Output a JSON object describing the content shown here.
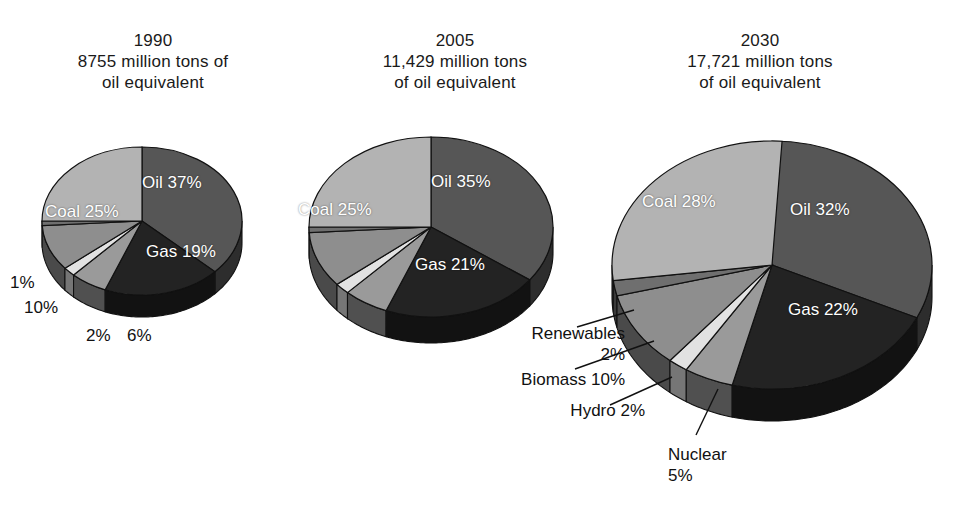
{
  "figure": {
    "background": "#ffffff",
    "label_color_inside": "#ffffff",
    "label_color_outside": "#111111"
  },
  "palette": {
    "oil": "#565656",
    "gas": "#232323",
    "coal": "#b3b3b3",
    "biomass": "#8e8e8e",
    "hydro": "#e2e2e2",
    "nuclear": "#9a9a9a",
    "renewables": "#6f6f6f",
    "edge": "#111111",
    "side_dark": "#2b2b2b"
  },
  "charts": [
    {
      "id": "1990",
      "title": "1990\n8755 million tons of\noil equivalent",
      "year": "1990",
      "total_text": "8755 million tons of oil equivalent",
      "slices": [
        {
          "name": "Oil",
          "label": "Oil 37%",
          "value": 37,
          "color_key": "oil",
          "inside": true
        },
        {
          "name": "Gas",
          "label": "Gas 19%",
          "value": 19,
          "color_key": "gas",
          "inside": true
        },
        {
          "name": "Nuclear",
          "label": "6%",
          "value": 6,
          "color_key": "nuclear",
          "inside": false
        },
        {
          "name": "Hydro",
          "label": "2%",
          "value": 2,
          "color_key": "hydro",
          "inside": false
        },
        {
          "name": "Biomass",
          "label": "10%",
          "value": 10,
          "color_key": "biomass",
          "inside": false
        },
        {
          "name": "Renewables",
          "label": "1%",
          "value": 1,
          "color_key": "renewables",
          "inside": false
        },
        {
          "name": "Coal",
          "label": "Coal 25%",
          "value": 25,
          "color_key": "coal",
          "inside": true
        }
      ]
    },
    {
      "id": "2005",
      "title": "2005\n11,429 million tons\nof oil equivalent",
      "year": "2005",
      "total_text": "11,429 million tons of oil equivalent",
      "slices": [
        {
          "name": "Oil",
          "label": "Oil 35%",
          "value": 35,
          "color_key": "oil",
          "inside": true
        },
        {
          "name": "Gas",
          "label": "Gas 21%",
          "value": 21,
          "color_key": "gas",
          "inside": true
        },
        {
          "name": "Nuclear",
          "label": "6%",
          "value": 6,
          "color_key": "nuclear",
          "inside": false
        },
        {
          "name": "Hydro",
          "label": "2%",
          "value": 2,
          "color_key": "hydro",
          "inside": false
        },
        {
          "name": "Biomass",
          "label": "10%",
          "value": 10,
          "color_key": "biomass",
          "inside": false
        },
        {
          "name": "Renewables",
          "label": "1%",
          "value": 1,
          "color_key": "renewables",
          "inside": false
        },
        {
          "name": "Coal",
          "label": "Coal 25%",
          "value": 25,
          "color_key": "coal",
          "inside": true
        }
      ]
    },
    {
      "id": "2030",
      "title": "2030\n17,721 million tons\nof oil equivalent",
      "year": "2030",
      "total_text": "17,721 million tons of oil equivalent",
      "slices": [
        {
          "name": "Oil",
          "label": "Oil 32%",
          "value": 32,
          "color_key": "oil",
          "inside": true
        },
        {
          "name": "Gas",
          "label": "Gas 22%",
          "value": 22,
          "color_key": "gas",
          "inside": true
        },
        {
          "name": "Nuclear",
          "label": "Nuclear\n5%",
          "value": 5,
          "color_key": "nuclear",
          "inside": false
        },
        {
          "name": "Hydro",
          "label": "Hydro 2%",
          "value": 2,
          "color_key": "hydro",
          "inside": false
        },
        {
          "name": "Biomass",
          "label": "Biomass 10%",
          "value": 10,
          "color_key": "biomass",
          "inside": false
        },
        {
          "name": "Renewables",
          "label": "Renewables\n2%",
          "value": 2,
          "color_key": "renewables",
          "inside": false
        },
        {
          "name": "Coal",
          "label": "Coal 28%",
          "value": 28,
          "color_key": "coal",
          "inside": true
        }
      ]
    }
  ],
  "labels_1990": {
    "oil": "Oil 37%",
    "gas": "Gas 19%",
    "coal": "Coal 25%",
    "renewables": "1%",
    "biomass": "10%",
    "hydro": "2%",
    "nuclear": "6%"
  },
  "labels_2005": {
    "oil": "Oil 35%",
    "gas": "Gas 21%",
    "coal": "Coal 25%"
  },
  "labels_2030": {
    "oil": "Oil 32%",
    "gas": "Gas 22%",
    "coal": "Coal 28%",
    "renewables": "Renewables\n2%",
    "biomass": "Biomass 10%",
    "hydro": "Hydro 2%",
    "nuclear": "Nuclear\n5%"
  },
  "chart_data": {
    "type": "pie",
    "unit": "million tons of oil equivalent",
    "legend": [
      "Oil",
      "Gas",
      "Coal",
      "Biomass",
      "Nuclear",
      "Hydro",
      "Renewables"
    ],
    "legend_position": "none",
    "charts": [
      {
        "name": "1990",
        "total": 8755,
        "total_label": "8755 million tons of oil equivalent",
        "categories": [
          "Oil",
          "Gas",
          "Nuclear",
          "Hydro",
          "Biomass",
          "Renewables",
          "Coal"
        ],
        "values": [
          37,
          19,
          6,
          2,
          10,
          1,
          25
        ],
        "value_labels": [
          "Oil 37%",
          "Gas 19%",
          "6%",
          "2%",
          "10%",
          "1%",
          "Coal 25%"
        ]
      },
      {
        "name": "2005",
        "total": 11429,
        "total_label": "11,429 million tons of oil equivalent",
        "categories": [
          "Oil",
          "Gas",
          "Nuclear",
          "Hydro",
          "Biomass",
          "Renewables",
          "Coal"
        ],
        "values": [
          35,
          21,
          6,
          2,
          10,
          1,
          25
        ],
        "value_labels": [
          "Oil 35%",
          "Gas 21%",
          "6%",
          "2%",
          "10%",
          "1%",
          "Coal 25%"
        ]
      },
      {
        "name": "2030",
        "total": 17721,
        "total_label": "17,721 million tons of oil equivalent",
        "categories": [
          "Oil",
          "Gas",
          "Nuclear",
          "Hydro",
          "Biomass",
          "Renewables",
          "Coal"
        ],
        "values": [
          32,
          22,
          5,
          2,
          10,
          2,
          28
        ],
        "value_labels": [
          "Oil 32%",
          "Gas 22%",
          "Nuclear 5%",
          "Hydro 2%",
          "Biomass 10%",
          "Renewables 2%",
          "Coal 28%"
        ]
      }
    ]
  }
}
